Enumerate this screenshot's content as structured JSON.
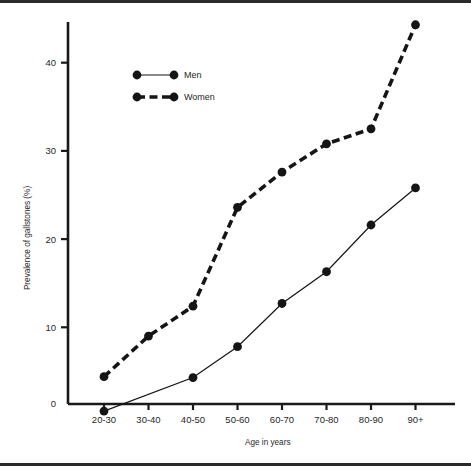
{
  "figure": {
    "background_color": "#ffffff",
    "ink_color": "#1a1a1a",
    "rule_color": "#2b2b2b"
  },
  "chart_data": {
    "type": "line",
    "title": "",
    "subtitle": "",
    "xlabel": "Age in years",
    "ylabel": "Prevalence of gallstones (%)",
    "categories": [
      "20-30",
      "30-40",
      "40-50",
      "50-60",
      "60-70",
      "70-80",
      "80-90",
      "90+"
    ],
    "yticks": [
      0,
      10,
      20,
      30,
      40
    ],
    "ytick_labels": [
      "0",
      "10",
      "20",
      "30",
      "40"
    ],
    "ylim": [
      0,
      46
    ],
    "grid": false,
    "legend_position": "upper-left-inside",
    "series": [
      {
        "name": "Men",
        "line_style": "solid",
        "marker": "circle",
        "color": "#151515",
        "values": [
          0.5,
          null,
          4.3,
          7.8,
          12.7,
          16.3,
          21.6,
          25.8
        ]
      },
      {
        "name": "Women",
        "line_style": "dashed",
        "marker": "circle",
        "color": "#151515",
        "values": [
          4.4,
          9.0,
          12.4,
          23.6,
          27.6,
          30.8,
          32.5,
          44.3
        ]
      }
    ]
  },
  "legend": {
    "entries": [
      {
        "label": "Men"
      },
      {
        "label": "Women"
      }
    ]
  },
  "axes": {
    "x_title": "Age in years",
    "y_title": "Prevalence of gallstones (%)",
    "x_tick_labels": [
      "20-30",
      "30-40",
      "40-50",
      "50-60",
      "60-70",
      "70-80",
      "80-90",
      "90+"
    ],
    "y_tick_labels": [
      "0",
      "10",
      "20",
      "30",
      "40"
    ]
  }
}
